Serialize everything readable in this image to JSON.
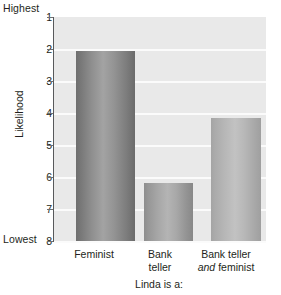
{
  "chart_data": {
    "type": "bar",
    "title": "",
    "xlabel": "Linda is a:",
    "ylabel": "Likelihood",
    "categories": [
      "Feminist",
      "Bank teller",
      "Bank teller and feminist"
    ],
    "category_lines": [
      [
        "Feminist"
      ],
      [
        "Bank",
        "teller"
      ],
      [
        "Bank teller",
        "and feminist"
      ]
    ],
    "values": [
      2.05,
      6.2,
      4.15
    ],
    "ylim": [
      1,
      8
    ],
    "y_inverted": true,
    "yticks": [
      1,
      2,
      3,
      4,
      5,
      6,
      7,
      8
    ],
    "ytick_labels": [
      "1",
      "2",
      "3",
      "4",
      "5",
      "6",
      "7",
      "8"
    ],
    "y_axis_high_label": "Highest",
    "y_axis_low_label": "Lowest",
    "grid": true,
    "legend": "none",
    "plot_background": "#e9e9e9",
    "gridline_color": "#fbfbfb",
    "axis_color": "#58595b",
    "bar_colors": [
      "#8e8e8e",
      "#a5a5a5",
      "#b6b6b6"
    ]
  },
  "axis": {
    "highest": "Highest",
    "lowest": "Lowest",
    "y_title": "Likelihood",
    "x_title": "Linda is a:"
  },
  "ticks": {
    "labels": [
      "1",
      "2",
      "3",
      "4",
      "5",
      "6",
      "7",
      "8"
    ]
  },
  "categories": {
    "c0_line1": "Feminist",
    "c1_line1": "Bank",
    "c1_line2": "teller",
    "c2_line1": "Bank teller",
    "c2_line2_italic": "and",
    "c2_line2_rest": " feminist"
  }
}
